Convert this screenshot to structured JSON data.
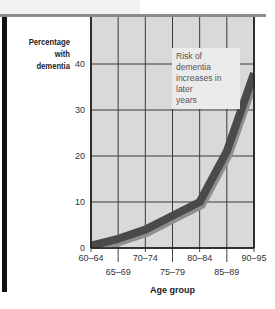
{
  "chart_data": {
    "type": "line",
    "title": "",
    "ylabel": "Percentage with dementia",
    "xlabel": "Age group",
    "categories": [
      "60–64",
      "65–69",
      "70–74",
      "75–79",
      "80–84",
      "85–89",
      "90–95"
    ],
    "series": [
      {
        "name": "Percentage with dementia",
        "values": [
          0.5,
          2,
          4,
          7,
          10,
          21,
          38
        ]
      }
    ],
    "yticks": [
      0,
      10,
      20,
      30,
      40
    ],
    "ylim": [
      0,
      44
    ],
    "grid": true,
    "annotation": "Risk of dementia increases in later years",
    "colors": {
      "line": "#4a4a4a",
      "shadow": "#8e8e8e",
      "plot_bg": "#d9d9d9",
      "grid": "#3a3a3a"
    }
  },
  "labels": {
    "ylabel_line1": "Percentage",
    "ylabel_line2": "with dementia",
    "xlabel": "Age group",
    "annotation_line1": "Risk of dementia",
    "annotation_line2": "increases in later",
    "annotation_line3": "years"
  }
}
